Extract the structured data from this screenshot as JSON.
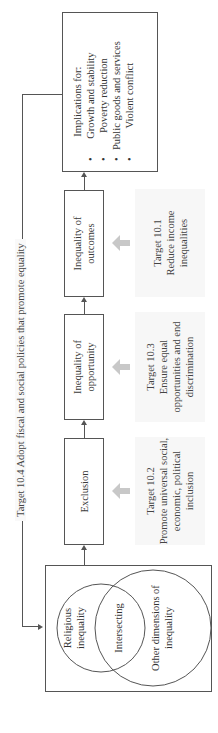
{
  "title": "Target 10.4 Adopt fiscal and social policies that promote equality",
  "venn": {
    "left": "Religious inequality",
    "middle": "Intersecting",
    "right": "Other dimensions of inequality"
  },
  "boxes": [
    {
      "id": "exclusion",
      "label": "Exclusion"
    },
    {
      "id": "opportunity",
      "label": "Inequality of opportunity"
    },
    {
      "id": "outcomes",
      "label": "Inequality of outcomes"
    }
  ],
  "implications": {
    "heading": "Implications for:",
    "items": [
      "Growth and stability",
      "Poverty reduction",
      "Public goods and services",
      "Violent conflict"
    ]
  },
  "targets": [
    {
      "id": "10.2",
      "label": "Target 10.2",
      "text": "Promote universal social, economic, political inclusion"
    },
    {
      "id": "10.3",
      "label": "Target 10.3",
      "text": "Ensure equal opportunities and end discrimination"
    },
    {
      "id": "10.1",
      "label": "Target 10.1",
      "text": "Reduce income inequalities"
    }
  ],
  "colors": {
    "line": "#555555",
    "gray_arrow": "#c8c8c8",
    "target_bg": "#f7f7f7"
  }
}
